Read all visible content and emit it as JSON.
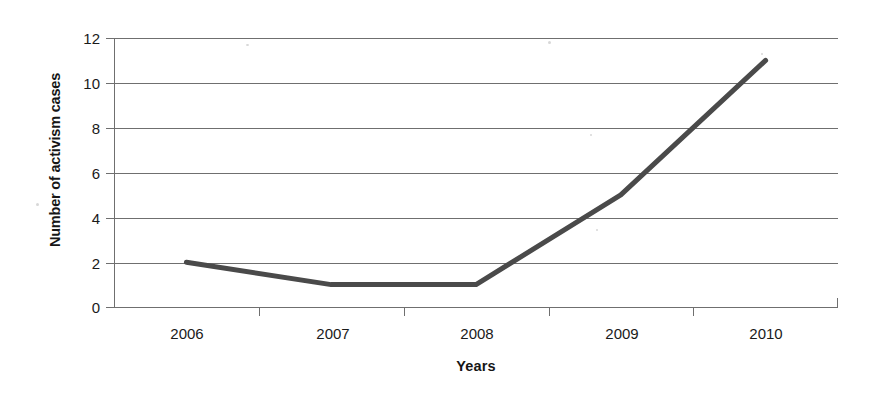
{
  "chart_data": {
    "type": "line",
    "title": "",
    "subtitle": "",
    "xlabel": "Years",
    "ylabel": "Number of activism cases",
    "categories": [
      "2006",
      "2007",
      "2008",
      "2009",
      "2010"
    ],
    "values": [
      2,
      1,
      1,
      5,
      11
    ],
    "series": [
      {
        "name": "Number of activism cases",
        "values": [
          2,
          1,
          1,
          5,
          11
        ]
      }
    ],
    "ylim": [
      0,
      12
    ],
    "y_ticks": [
      0,
      2,
      4,
      6,
      8,
      10,
      12
    ],
    "y_tick_labels": [
      "0",
      "2",
      "4",
      "6",
      "8",
      "10",
      "12"
    ],
    "x_tick_labels": [
      "2006",
      "2007",
      "2008",
      "2009",
      "2010"
    ],
    "grid": "horizontal",
    "legend": "none",
    "markers": "none",
    "line_color": "#4a4a4a",
    "grid_color": "#6f6f6f",
    "axis_color": "#6f6f6f",
    "background_color": "#ffffff",
    "text_color": "#1a1a1a",
    "line_width": 5,
    "annotations": []
  }
}
